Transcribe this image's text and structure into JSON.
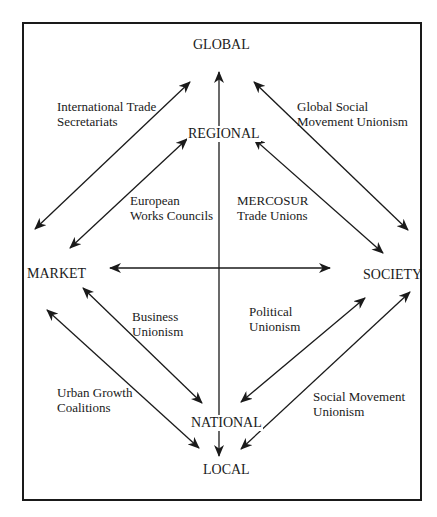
{
  "diagram": {
    "type": "scale-and-sphere matrix of labour strategies",
    "nodes": {
      "global": "GLOBAL",
      "regional": "REGIONAL",
      "market": "MARKET",
      "society": "SOCIETY",
      "national": "NATIONAL",
      "local": "LOCAL"
    },
    "relations": {
      "international_trade_secretariats": [
        "International Trade",
        "Secretariats"
      ],
      "global_social_movement_unionism": [
        "Global Social",
        "Movement Unionism"
      ],
      "european_works_councils": [
        "European",
        "Works Councils"
      ],
      "mercosur_trade_unions": [
        "MERCOSUR",
        "Trade Unions"
      ],
      "business_unionism": [
        "Business",
        "Unionism"
      ],
      "political_unionism": [
        "Political",
        "Unionism"
      ],
      "urban_growth_coalitions": [
        "Urban Growth",
        "Coalitions"
      ],
      "social_movement_unionism": [
        "Social Movement",
        "Unionism"
      ]
    },
    "edges": [
      {
        "from": "market",
        "to": "global",
        "label": "international_trade_secretariats",
        "bidirectional": true
      },
      {
        "from": "market",
        "to": "regional",
        "label": "european_works_councils",
        "bidirectional": true
      },
      {
        "from": "global",
        "to": "society",
        "label": "global_social_movement_unionism",
        "bidirectional": true
      },
      {
        "from": "regional",
        "to": "society",
        "label": "mercosur_trade_unions",
        "bidirectional": true
      },
      {
        "from": "market",
        "to": "society",
        "label": "",
        "bidirectional": true
      },
      {
        "from": "global",
        "to": "local",
        "label": "",
        "bidirectional": true
      },
      {
        "from": "market",
        "to": "national",
        "label": "business_unionism",
        "bidirectional": true
      },
      {
        "from": "market",
        "to": "local",
        "label": "urban_growth_coalitions",
        "bidirectional": true
      },
      {
        "from": "society",
        "to": "national",
        "label": "political_unionism",
        "bidirectional": true
      },
      {
        "from": "society",
        "to": "local",
        "label": "social_movement_unionism",
        "bidirectional": true
      }
    ],
    "colors": {
      "line": "#1a1a1a",
      "background": "#ffffff"
    }
  }
}
